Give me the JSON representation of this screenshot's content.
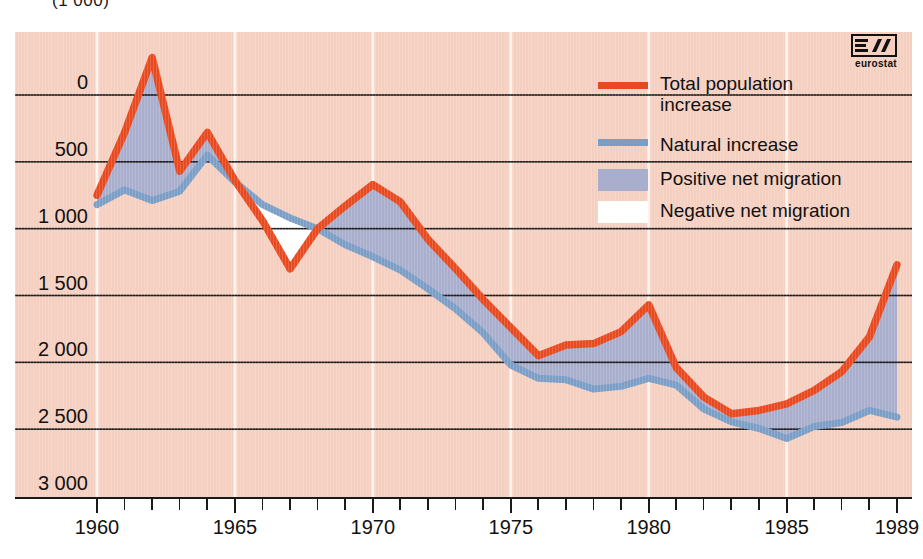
{
  "header": {
    "unit_label": "(1 000)"
  },
  "logo": {
    "name": "eurostat",
    "caption": "eurostat"
  },
  "legend": {
    "position": "inside-top-right",
    "items": [
      {
        "label": "Total population increase",
        "label_line1": "Total population",
        "label_line2": "increase",
        "type": "line",
        "color": "#e8491f",
        "name": "total-population-increase"
      },
      {
        "label": "Natural increase",
        "label_line1": "Natural increase",
        "label_line2": "",
        "type": "line",
        "color": "#7b9ec6",
        "name": "natural-increase"
      },
      {
        "label": "Positive net migration",
        "label_line1": "Positive net migration",
        "label_line2": "",
        "type": "area",
        "color": "#a9aecd",
        "name": "positive-net-migration"
      },
      {
        "label": "Negative net migration",
        "label_line1": "Negative net migration",
        "label_line2": "",
        "type": "area",
        "color": "#ffffff",
        "name": "negative-net-migration"
      }
    ]
  },
  "colors": {
    "plot_background": "#f5cfc0",
    "total_line": "#e8491f",
    "natural_line": "#7b9ec6",
    "positive_fill": "#a9aecd",
    "negative_fill": "#ffffff",
    "gridline": "#1a1a1a",
    "vertical_gridline": "#fdf2ec"
  },
  "chart_data": {
    "type": "area",
    "title": "",
    "subtitle": "",
    "xlabel": "",
    "ylabel": "(1 000)",
    "unit": "1 000",
    "grid": true,
    "xlim": [
      1960,
      1989
    ],
    "ylim": [
      0,
      3300
    ],
    "yticks": [
      0,
      500,
      1000,
      1500,
      2000,
      2500,
      3000
    ],
    "ytick_labels": [
      "0",
      "500",
      "1 000",
      "1 500",
      "2 000",
      "2 500",
      "3 000"
    ],
    "xticks": [
      1960,
      1961,
      1962,
      1963,
      1964,
      1965,
      1966,
      1967,
      1968,
      1969,
      1970,
      1971,
      1972,
      1973,
      1974,
      1975,
      1976,
      1977,
      1978,
      1979,
      1980,
      1981,
      1982,
      1983,
      1984,
      1985,
      1986,
      1987,
      1988,
      1989
    ],
    "xtick_labels_shown": [
      "1960",
      "1965",
      "1970",
      "1975",
      "1980",
      "1985",
      "1989"
    ],
    "x": [
      1960,
      1961,
      1962,
      1963,
      1964,
      1965,
      1966,
      1967,
      1968,
      1969,
      1970,
      1971,
      1972,
      1973,
      1974,
      1975,
      1976,
      1977,
      1978,
      1979,
      1980,
      1981,
      1982,
      1983,
      1984,
      1985,
      1986,
      1987,
      1988,
      1989
    ],
    "series": [
      {
        "name": "Total population increase",
        "color": "#e8491f",
        "values": [
          2250,
          2720,
          3280,
          2430,
          2720,
          2360,
          2060,
          1700,
          2000,
          2170,
          2330,
          2200,
          1920,
          1700,
          1470,
          1260,
          1050,
          1130,
          1140,
          1230,
          1430,
          960,
          740,
          615,
          640,
          690,
          790,
          930,
          1190,
          1730
        ]
      },
      {
        "name": "Natural increase",
        "color": "#7b9ec6",
        "values": [
          2180,
          2290,
          2210,
          2280,
          2550,
          2350,
          2180,
          2080,
          2000,
          1880,
          1790,
          1690,
          1550,
          1400,
          1220,
          980,
          880,
          870,
          800,
          820,
          880,
          830,
          650,
          555,
          505,
          430,
          520,
          550,
          640,
          590
        ]
      }
    ],
    "legend_entries": [
      "Total population increase",
      "Natural increase",
      "Positive net migration",
      "Negative net migration"
    ],
    "annotations": [
      {
        "text": "Negative net migration period",
        "x_range": [
          1965,
          1968
        ]
      }
    ]
  },
  "axes": {
    "y_labels": [
      "3 000",
      "2 500",
      "2 000",
      "1 500",
      "1 000",
      "500",
      "0"
    ],
    "x_labels": [
      "1960",
      "1965",
      "1970",
      "1975",
      "1980",
      "1985",
      "1989"
    ]
  }
}
